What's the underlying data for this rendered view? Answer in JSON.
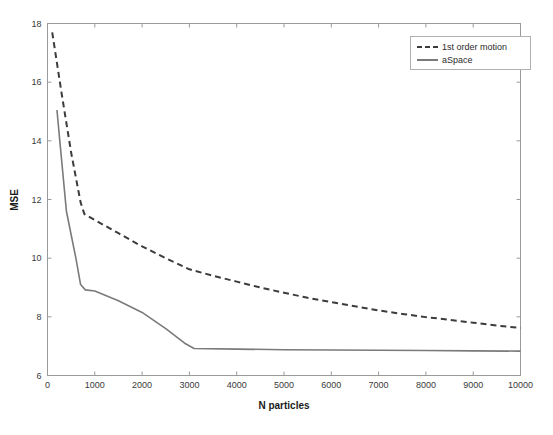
{
  "chart_data": {
    "type": "line",
    "title": "",
    "xlabel": "N particles",
    "ylabel": "MSE",
    "xlim": [
      0,
      10000
    ],
    "ylim": [
      6,
      18
    ],
    "xticks": [
      0,
      1000,
      2000,
      3000,
      4000,
      5000,
      6000,
      7000,
      8000,
      9000,
      10000
    ],
    "yticks": [
      6,
      8,
      10,
      12,
      14,
      16,
      18
    ],
    "xtick_labels": [
      "0",
      "1000",
      "2000",
      "3000",
      "4000",
      "5000",
      "6000",
      "7000",
      "8000",
      "9000",
      "10000"
    ],
    "ytick_labels": [
      "6",
      "8",
      "10",
      "12",
      "14",
      "16",
      "18"
    ],
    "grid": false,
    "legend_position": "top-right",
    "series": [
      {
        "name": "1st order motion",
        "style": "dashed",
        "color": "#3c3c3c",
        "x": [
          100,
          300,
          500,
          700,
          780,
          1000,
          1500,
          2000,
          2500,
          3000,
          3500,
          4000,
          4500,
          5000,
          5500,
          6000,
          6500,
          7000,
          7500,
          8000,
          8500,
          9000,
          9500,
          10000
        ],
        "y": [
          17.7,
          15.6,
          13.6,
          11.9,
          11.5,
          11.3,
          10.85,
          10.4,
          10.0,
          9.62,
          9.4,
          9.2,
          9.0,
          8.82,
          8.65,
          8.5,
          8.36,
          8.22,
          8.1,
          7.99,
          7.9,
          7.8,
          7.7,
          7.62
        ]
      },
      {
        "name": "aSpace",
        "style": "solid",
        "color": "#7a7a7a",
        "x": [
          200,
          260,
          400,
          600,
          700,
          800,
          1000,
          1500,
          2000,
          2500,
          2900,
          3100,
          4000,
          5000,
          6000,
          7000,
          8000,
          9000,
          10000
        ],
        "y": [
          15.05,
          14.0,
          11.6,
          10.0,
          9.1,
          8.92,
          8.88,
          8.55,
          8.15,
          7.6,
          7.1,
          6.92,
          6.9,
          6.88,
          6.87,
          6.86,
          6.85,
          6.84,
          6.83
        ]
      }
    ]
  },
  "legend": {
    "entries": [
      {
        "label": "1st order motion"
      },
      {
        "label": "aSpace"
      }
    ]
  },
  "axes": {
    "y_axis_title": "MSE",
    "x_axis_title": "N particles"
  }
}
